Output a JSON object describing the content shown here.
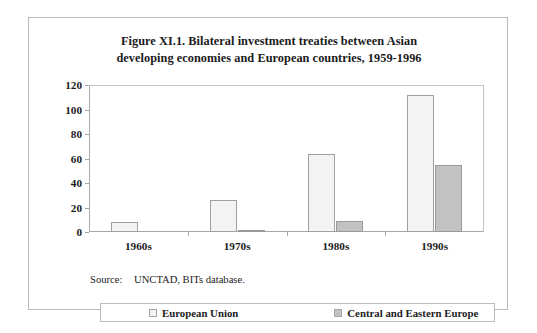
{
  "figure": {
    "title_lines": [
      "Figure XI.1. Bilateral investment treaties between Asian",
      "developing economies and European countries, 1959-1996"
    ],
    "source_label": "Source:",
    "source_text": "UNCTAD, BITs database."
  },
  "legend": {
    "entries": [
      {
        "label": "European Union",
        "swatch": "eu",
        "color": "#f3f3f3"
      },
      {
        "label": "Central and Eastern Europe",
        "swatch": "cee",
        "color": "#c2c2c2"
      }
    ]
  },
  "chart_data": {
    "type": "bar",
    "title": "Figure XI.1. Bilateral investment treaties between Asian developing economies and European countries, 1959-1996",
    "xlabel": "",
    "ylabel": "",
    "ylim": [
      0,
      120
    ],
    "yticks": [
      0,
      20,
      40,
      60,
      80,
      100,
      120
    ],
    "ytick_labels": [
      "0",
      "20",
      "40",
      "60",
      "80",
      "100",
      "120"
    ],
    "grid": false,
    "legend_position": "bottom",
    "categories": [
      "1960s",
      "1970s",
      "1980s",
      "1990s"
    ],
    "series": [
      {
        "name": "European Union",
        "color": "#f3f3f3",
        "values": [
          8,
          26,
          64,
          112
        ]
      },
      {
        "name": "Central and Eastern Europe",
        "color": "#c2c2c2",
        "values": [
          0,
          1,
          9,
          55
        ]
      }
    ]
  }
}
